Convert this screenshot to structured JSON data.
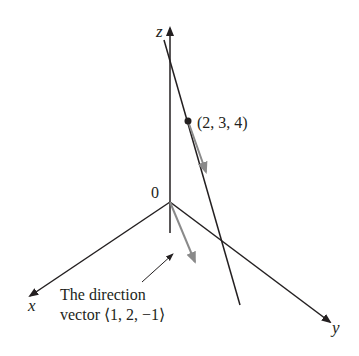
{
  "diagram": {
    "axes": {
      "x_label": "x",
      "y_label": "y",
      "z_label": "z",
      "origin_label": "0"
    },
    "point": {
      "label": "(2, 3, 4)",
      "coords": [
        2,
        3,
        4
      ]
    },
    "direction_vector": {
      "caption_line1": "The direction",
      "caption_line2": "vector ⟨1, 2, −1⟩",
      "components": [
        1,
        2,
        -1
      ]
    },
    "colors": {
      "axis": "#231f20",
      "vector": "#8a8a8a",
      "line": "#231f20"
    }
  }
}
